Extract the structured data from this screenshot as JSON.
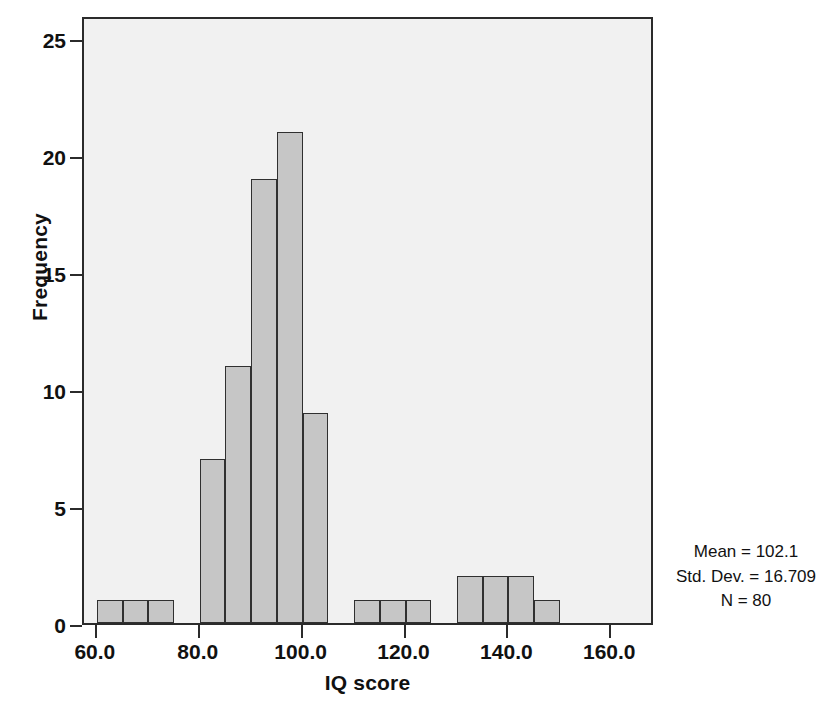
{
  "chart_data": {
    "type": "bar",
    "title": "",
    "subtitle": "",
    "xlabel": "IQ score",
    "ylabel": "Frequency",
    "xlim": [
      57.5,
      168.5
    ],
    "ylim": [
      0,
      26
    ],
    "bin_width": 5,
    "grid": false,
    "legend_position": "none",
    "categories": [
      "60-65",
      "65-70",
      "70-75",
      "75-80",
      "80-85",
      "85-90",
      "90-95",
      "95-100",
      "100-105",
      "105-110",
      "110-115",
      "115-120",
      "120-125",
      "125-130",
      "130-135",
      "135-140",
      "140-145",
      "145-150",
      "150-155",
      "155-160"
    ],
    "bin_starts": [
      60,
      65,
      70,
      75,
      80,
      85,
      90,
      95,
      100,
      105,
      110,
      115,
      120,
      125,
      130,
      135,
      140,
      145,
      150,
      155
    ],
    "values": [
      1,
      1,
      1,
      0,
      7,
      11,
      19,
      21,
      9,
      0,
      1,
      1,
      1,
      0,
      2,
      2,
      2,
      1,
      0,
      0
    ],
    "xticks": [
      60,
      80,
      100,
      120,
      140,
      160
    ],
    "xtick_labels": [
      "60.0",
      "80.0",
      "100.0",
      "120.0",
      "140.0",
      "160.0"
    ],
    "yticks": [
      0,
      5,
      10,
      15,
      20,
      25
    ],
    "ytick_labels": [
      "0",
      "5",
      "10",
      "15",
      "20",
      "25"
    ],
    "annotations": [
      "Mean = 102.1",
      "Std. Dev. = 16.709",
      "N = 80"
    ],
    "colors": {
      "bar_fill": "#c6c6c6",
      "bar_edge": "#303030",
      "plot_background": "#f1f1f1",
      "frame": "#2b2b2b",
      "text": "#111111",
      "figure_background": "#ffffff"
    }
  },
  "stats": {
    "mean_label": "Mean = 102.1",
    "std_dev_label": "Std. Dev. = 16.709",
    "n_label": "N = 80"
  }
}
